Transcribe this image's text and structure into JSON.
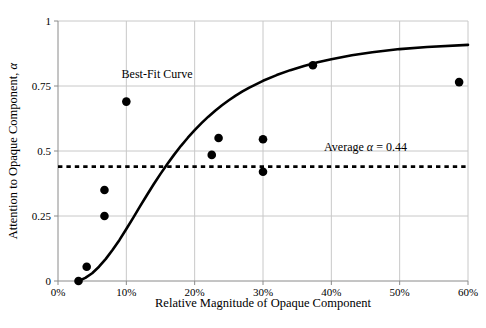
{
  "chart_data": {
    "type": "scatter",
    "title": "",
    "xlabel": "Relative Magnitude of Opaque Component",
    "ylabel": "Attention to Opaque Component, α",
    "xlim": [
      0,
      60
    ],
    "ylim": [
      0,
      1
    ],
    "grid": true,
    "legend": "none",
    "x_tick_labels": [
      "0%",
      "10%",
      "20%",
      "30%",
      "40%",
      "50%",
      "60%"
    ],
    "x_tick_values": [
      0,
      10,
      20,
      30,
      40,
      50,
      60
    ],
    "y_tick_labels": [
      "0",
      "0.25",
      "0.5",
      "0.75",
      "1"
    ],
    "y_tick_values": [
      0,
      0.25,
      0.5,
      0.75,
      1
    ],
    "points": [
      {
        "x": 3.0,
        "y": 0.0
      },
      {
        "x": 4.2,
        "y": 0.055
      },
      {
        "x": 6.8,
        "y": 0.25
      },
      {
        "x": 6.8,
        "y": 0.35
      },
      {
        "x": 10.0,
        "y": 0.69
      },
      {
        "x": 22.5,
        "y": 0.485
      },
      {
        "x": 23.5,
        "y": 0.55
      },
      {
        "x": 30.0,
        "y": 0.42
      },
      {
        "x": 30.0,
        "y": 0.545
      },
      {
        "x": 37.3,
        "y": 0.83
      },
      {
        "x": 58.7,
        "y": 0.765
      }
    ],
    "series": [
      {
        "name": "Best-Fit Curve",
        "type": "line",
        "style": "solid",
        "x": [
          3.0,
          4.0,
          5.0,
          6.0,
          7.0,
          8.0,
          9.0,
          10.0,
          11.0,
          12.0,
          13.0,
          14.0,
          15.0,
          16.0,
          17.0,
          18.0,
          19.0,
          20.0,
          21.0,
          22.0,
          23.0,
          24.0,
          25.0,
          26.0,
          27.0,
          28.0,
          30.0,
          32.0,
          34.0,
          36.0,
          38.0,
          40.0,
          43.0,
          46.0,
          50.0,
          54.0,
          60.0
        ],
        "y": [
          0.0,
          0.012,
          0.03,
          0.055,
          0.085,
          0.12,
          0.158,
          0.2,
          0.243,
          0.287,
          0.33,
          0.372,
          0.412,
          0.45,
          0.486,
          0.52,
          0.551,
          0.58,
          0.607,
          0.632,
          0.655,
          0.676,
          0.695,
          0.713,
          0.729,
          0.744,
          0.77,
          0.792,
          0.811,
          0.827,
          0.841,
          0.853,
          0.868,
          0.88,
          0.892,
          0.9,
          0.908
        ]
      },
      {
        "name": "Average α = 0.44",
        "type": "hline",
        "style": "dashed",
        "value": 0.44
      }
    ],
    "annotations": [
      {
        "name": "best-fit-curve-label",
        "text": "Best-Fit Curve",
        "x": 14.5,
        "y": 0.78
      },
      {
        "name": "average-alpha-label",
        "text_parts": {
          "prefix": "Average ",
          "symbol": "α",
          "suffix": " = 0.44"
        },
        "text": "Average α = 0.44",
        "x": 45.0,
        "y": 0.5
      }
    ],
    "colors": {
      "marker": "#000000",
      "curve": "#000000",
      "average_line": "#000000",
      "grid": "#c8c8c8",
      "axis": "#808080",
      "background": "#ffffff"
    }
  },
  "axis_labels": {
    "y_title": "Attention to Opaque Component, α",
    "y_title_prefix": "Attention to Opaque Component, ",
    "y_title_symbol": "α",
    "x_title": "Relative Magnitude of Opaque Component"
  }
}
